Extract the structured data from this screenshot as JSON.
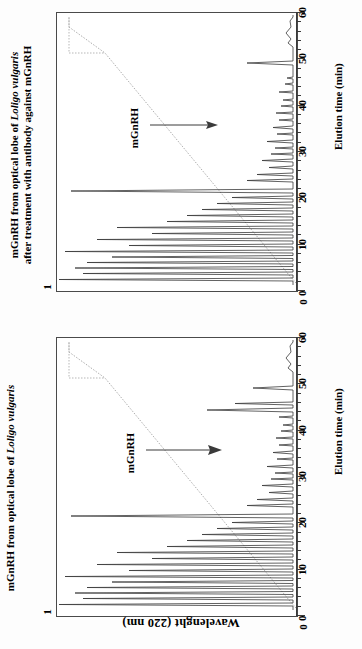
{
  "figure": {
    "y_axis_label": "Wavelenght (220 nm)",
    "x_axis_label": "Elution time (min)",
    "y_min_label": "0",
    "y_max_label": "1",
    "orientation_note": "rotated-90"
  },
  "panels": [
    {
      "id": "panel-top",
      "title_line1": "mGnRH from optical lobe of ",
      "title_species": "Loligo vulgaris",
      "title_line2": "after treatment with antibody against mGnRH",
      "annotation": "mGnRH"
    },
    {
      "id": "panel-bottom",
      "title_line1": "mGnRH from optical lobe of ",
      "title_species": "Loligo vulgaris",
      "title_line2": "",
      "annotation": "mGnRH"
    }
  ],
  "chart_data": {
    "type": "line",
    "xlabel": "Elution time (min)",
    "ylabel": "Wavelenght (220 nm)",
    "xlim": [
      0,
      60
    ],
    "ylim": [
      0,
      1
    ],
    "xticks": [
      0,
      10,
      20,
      30,
      40,
      50,
      60
    ],
    "xtick_minor_step": 2,
    "yticks": [
      0,
      1
    ],
    "grid": false,
    "legend": false,
    "series": [
      {
        "name": "chromatogram-bottom-untreated",
        "panel": "panel-bottom",
        "description": "Absorbance trace 220 nm, untreated optical lobe extract",
        "peaks": [
          {
            "x": 1.2,
            "y": 0.97
          },
          {
            "x": 2.0,
            "y": 0.86
          },
          {
            "x": 2.6,
            "y": 0.9
          },
          {
            "x": 3.3,
            "y": 0.88
          },
          {
            "x": 4.1,
            "y": 0.8
          },
          {
            "x": 4.8,
            "y": 0.74
          },
          {
            "x": 5.6,
            "y": 0.66
          },
          {
            "x": 6.4,
            "y": 0.78
          },
          {
            "x": 7.2,
            "y": 0.62
          },
          {
            "x": 8.0,
            "y": 0.7
          },
          {
            "x": 8.9,
            "y": 0.55
          },
          {
            "x": 9.7,
            "y": 0.48
          },
          {
            "x": 10.6,
            "y": 0.4
          },
          {
            "x": 11.4,
            "y": 0.33
          },
          {
            "x": 12.2,
            "y": 0.28
          },
          {
            "x": 13.0,
            "y": 0.22
          },
          {
            "x": 14.0,
            "y": 0.8
          },
          {
            "x": 15.1,
            "y": 0.18
          },
          {
            "x": 16.2,
            "y": 0.12
          },
          {
            "x": 18.0,
            "y": 0.07
          },
          {
            "x": 20.5,
            "y": 0.1
          },
          {
            "x": 21.5,
            "y": 0.09
          },
          {
            "x": 22.5,
            "y": 0.08
          },
          {
            "x": 24.0,
            "y": 0.06
          },
          {
            "x": 26.0,
            "y": 0.05
          },
          {
            "x": 28.5,
            "y": 0.07
          },
          {
            "x": 30.5,
            "y": 0.05
          },
          {
            "x": 36.8,
            "y": 0.22
          },
          {
            "x": 37.6,
            "y": 0.18
          },
          {
            "x": 44.5,
            "y": 0.14
          },
          {
            "x": 50.5,
            "y": 0.05
          },
          {
            "x": 53.0,
            "y": 0.06
          },
          {
            "x": 58.0,
            "y": 0.04
          }
        ],
        "mgnrh_peak_x": 37.0
      },
      {
        "name": "chromatogram-top-antibody-treated",
        "panel": "panel-top",
        "description": "Absorbance trace 220 nm, after treatment with antibody against mGnRH",
        "peaks": [
          {
            "x": 1.2,
            "y": 0.97
          },
          {
            "x": 2.0,
            "y": 0.88
          },
          {
            "x": 2.6,
            "y": 0.91
          },
          {
            "x": 3.3,
            "y": 0.86
          },
          {
            "x": 4.1,
            "y": 0.79
          },
          {
            "x": 4.8,
            "y": 0.72
          },
          {
            "x": 5.6,
            "y": 0.67
          },
          {
            "x": 6.4,
            "y": 0.76
          },
          {
            "x": 7.2,
            "y": 0.6
          },
          {
            "x": 8.0,
            "y": 0.68
          },
          {
            "x": 8.9,
            "y": 0.53
          },
          {
            "x": 9.7,
            "y": 0.46
          },
          {
            "x": 10.6,
            "y": 0.39
          },
          {
            "x": 11.4,
            "y": 0.32
          },
          {
            "x": 12.2,
            "y": 0.26
          },
          {
            "x": 13.0,
            "y": 0.2
          },
          {
            "x": 14.2,
            "y": 0.82
          },
          {
            "x": 15.3,
            "y": 0.16
          },
          {
            "x": 16.4,
            "y": 0.11
          },
          {
            "x": 18.2,
            "y": 0.07
          },
          {
            "x": 20.5,
            "y": 0.09
          },
          {
            "x": 21.8,
            "y": 0.08
          },
          {
            "x": 23.0,
            "y": 0.07
          },
          {
            "x": 25.0,
            "y": 0.05
          },
          {
            "x": 27.0,
            "y": 0.06
          },
          {
            "x": 29.0,
            "y": 0.05
          },
          {
            "x": 31.0,
            "y": 0.04
          },
          {
            "x": 37.2,
            "y": 0.05
          },
          {
            "x": 44.6,
            "y": 0.2
          },
          {
            "x": 50.5,
            "y": 0.05
          },
          {
            "x": 53.0,
            "y": 0.06
          },
          {
            "x": 58.0,
            "y": 0.04
          }
        ],
        "mgnrh_peak_x": 37.2
      },
      {
        "name": "solvent-gradient",
        "panel": "both",
        "description": "Acetonitrile gradient, dotted line",
        "points": [
          {
            "x": 0,
            "y": 0.03
          },
          {
            "x": 5,
            "y": 0.06
          },
          {
            "x": 50,
            "y": 0.82
          },
          {
            "x": 55,
            "y": 0.97
          },
          {
            "x": 60,
            "y": 0.97
          }
        ]
      }
    ]
  }
}
